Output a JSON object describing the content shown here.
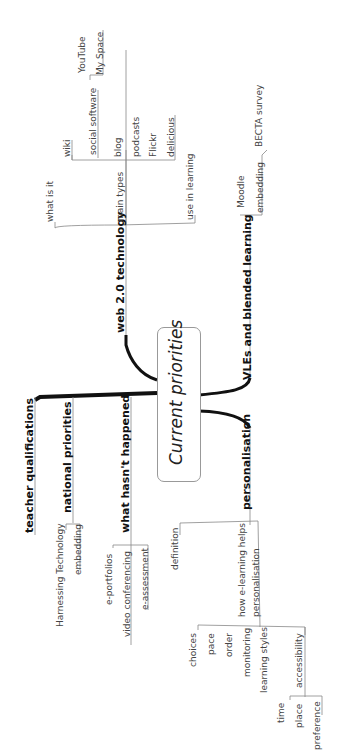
{
  "center": {
    "label": "Current priorities"
  },
  "branches": {
    "web20": {
      "label": "web 2.0 technology",
      "children": {
        "what_is_it": "what is it",
        "main_types": "main types",
        "use_in_learning": "use in learning",
        "wiki": "wiki",
        "social_software": "social software",
        "blog": "blog",
        "podcasts": "podcasts",
        "flickr": "Flickr",
        "delicious": "delicious",
        "youtube": "YouTube",
        "myspace": "My Space"
      }
    },
    "vles": {
      "label": "VLEs and blended learning",
      "children": {
        "moodle": "Moodle",
        "embedding": "embedding",
        "becta": "BECTA survey"
      }
    },
    "teacher": {
      "label": "teacher qualifications"
    },
    "national": {
      "label": "national priorities",
      "children": {
        "harnessing": "Harnessing Technology",
        "embedding": "embedding"
      }
    },
    "hasnt": {
      "label": "what hasn't happened",
      "children": {
        "eportfolios": "e-portfolios",
        "video": "video conferencing",
        "eassessment": "e-assessment"
      }
    },
    "personalisation": {
      "label": "personalisation",
      "children": {
        "definition": "definition",
        "how_line1": "how e-learning helps",
        "how_line2": "personalisation",
        "choices": "choices",
        "pace": "pace",
        "order": "order",
        "monitoring": "monitoring",
        "learning_styles": "learning styles",
        "accessibility": "accessibility",
        "time": "time",
        "place": "place",
        "preference": "preference"
      }
    }
  }
}
